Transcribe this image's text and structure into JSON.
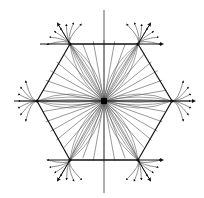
{
  "diagram": {
    "type": "phase-portrait",
    "colors": {
      "background": "#ffffff",
      "stroke": "#111111",
      "light_stroke": "#555555"
    },
    "center": {
      "x": 104,
      "y": 101
    },
    "hexagon_vertices": [
      {
        "name": "top-left",
        "x": 70,
        "y": 44
      },
      {
        "name": "top-right",
        "x": 138,
        "y": 44
      },
      {
        "name": "right",
        "x": 172,
        "y": 101
      },
      {
        "name": "bottom-right",
        "x": 138,
        "y": 160
      },
      {
        "name": "bottom-left",
        "x": 70,
        "y": 160
      },
      {
        "name": "left",
        "x": 37,
        "y": 101
      }
    ],
    "axes": {
      "horizontal": {
        "x1": 14,
        "x2": 194,
        "y": 101
      },
      "vertical": {
        "x": 104,
        "y1": 10,
        "y2": 193
      }
    }
  }
}
